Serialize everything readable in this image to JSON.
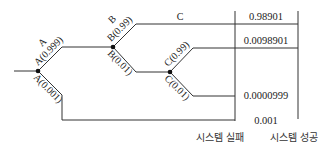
{
  "diagram": {
    "type": "event-tree",
    "nodes": {
      "A": {
        "name": "A",
        "success_label": "A(0.999)",
        "failure_label": "A(0.001)"
      },
      "B": {
        "name": "B",
        "success_label": "B(0.99)",
        "failure_label": "B(0.01)"
      },
      "C": {
        "name": "C",
        "success_label": "C(0.99)",
        "failure_label": "C(0.01)"
      }
    },
    "outcomes": [
      {
        "path": "A-B",
        "value": "0.98901",
        "column": "success"
      },
      {
        "path": "A-B-C(0.99)",
        "value": "0.0098901",
        "column": "success"
      },
      {
        "path": "A-B-C(0.01)",
        "value": "0.0000999",
        "column": "failure"
      },
      {
        "path": "A(0.001)",
        "value": "0.001",
        "column": "failure"
      }
    ],
    "columns": {
      "failure": "시스템 실패",
      "success": "시스템 성공"
    }
  }
}
